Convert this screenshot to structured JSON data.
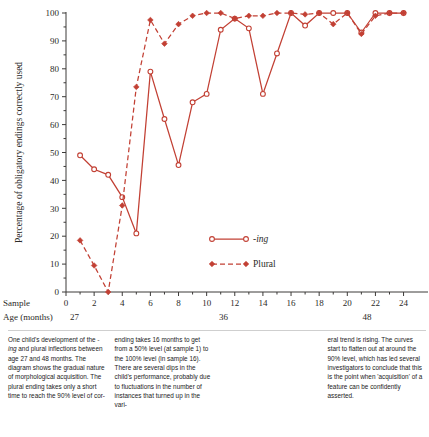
{
  "figure": {
    "accent_color": "#c0392b",
    "line_color": "#c24034",
    "axis_color": "#3c3a38",
    "y_axis": {
      "label": "Percentage of obligatory endings correctly used",
      "ticks": [
        "0",
        "10",
        "20",
        "30",
        "40",
        "50",
        "60",
        "70",
        "80",
        "90",
        "100"
      ],
      "min": 0,
      "max": 100
    },
    "x_axis": {
      "sample_label": "Sample",
      "age_label": "Age (months)",
      "sample_ticks": [
        "0",
        "2",
        "4",
        "6",
        "8",
        "10",
        "12",
        "14",
        "16",
        "18",
        "20",
        "22",
        "24"
      ],
      "age_ticks": [
        {
          "label": "27",
          "sample": 0.6
        },
        {
          "label": "36",
          "sample": 11.2
        },
        {
          "label": "48",
          "sample": 21.4
        }
      ],
      "min": 0,
      "max": 24.6
    },
    "legend": [
      {
        "name": "ing-series",
        "label": "-ing",
        "italic": true,
        "style": "solid",
        "marker": "open-circle"
      },
      {
        "name": "plural-series",
        "label": "Plural",
        "italic": false,
        "style": "dashed",
        "marker": "filled-diamond"
      }
    ]
  },
  "chart_data": {
    "type": "line",
    "title": "One child's development of the -ing and plural inflections between age 27 and 48 months",
    "xlabel": "Sample",
    "ylabel": "Percentage of obligatory endings correctly used",
    "xlim": [
      0,
      24.6
    ],
    "ylim": [
      0,
      100
    ],
    "grid": false,
    "legend_position": "center",
    "x": [
      1,
      2,
      3,
      4,
      5,
      6,
      7,
      8,
      9,
      10,
      11,
      12,
      13,
      14,
      15,
      16,
      17,
      18,
      19,
      20,
      21,
      22,
      23,
      24
    ],
    "series": [
      {
        "name": "-ing",
        "style": "solid",
        "marker": "open-circle",
        "values": [
          49,
          44,
          42,
          34,
          21,
          79,
          62,
          45.5,
          68,
          71,
          94,
          98,
          94.5,
          71,
          85.5,
          100,
          95.5,
          100,
          100,
          100,
          93,
          100,
          100,
          100
        ]
      },
      {
        "name": "Plural",
        "style": "dashed",
        "marker": "filled-diamond",
        "values": [
          18.5,
          9.5,
          0,
          31,
          73.5,
          97.5,
          89,
          96,
          99,
          100,
          100,
          98,
          99,
          99,
          100,
          100,
          99.5,
          100,
          96,
          100,
          92.5,
          99,
          100,
          100
        ]
      }
    ]
  },
  "caption": {
    "col1": "One child's development of the -ing and plural inflections between age 27 and 48 months. The diagram shows the gradual nature of morphological acquisition. The plural ending takes only a short time to reach the 90% level of cor-",
    "col1_parts": {
      "pre": "One child's development of the ",
      "italic": "-ing",
      "post": " and plural inflections between age 27 and 48 months. The diagram shows the gradual nature of morphological acquisition. The plural ending takes only a short time to reach the 90% level of cor-"
    },
    "col2": "ending takes 16 months to get from a 50% level (at sample 1) to the 100% level (in sample 16). There are several dips in the child's performance, probably due to fluctuations in the number of instances that turned up in the vari-",
    "col3": "eral trend is rising. The curves start to flatten out at around the 90% level, which has led several investigators to conclude that this is the point when 'acquisition' of a feature can be confidently asserted.",
    "col4": ""
  }
}
